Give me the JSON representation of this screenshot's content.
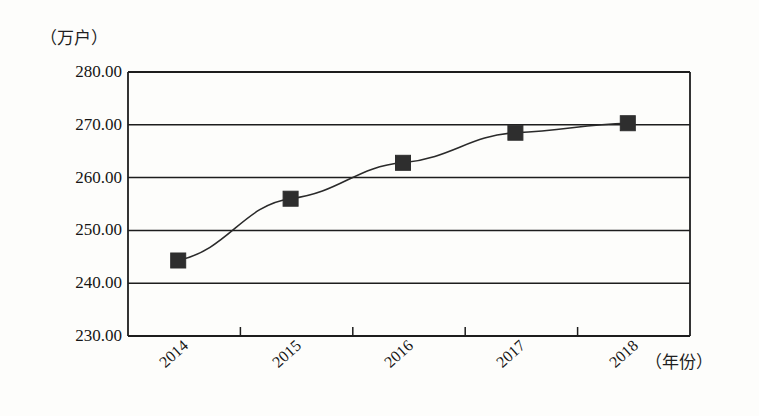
{
  "chart_data": {
    "type": "line",
    "title": "",
    "subtitle": "",
    "xlabel": "（年份）",
    "ylabel": "（万户）",
    "categories": [
      "2014",
      "2015",
      "2016",
      "2017",
      "2018"
    ],
    "series": [
      {
        "name": "",
        "values": [
          244.3,
          256.0,
          262.8,
          268.5,
          270.3
        ]
      }
    ],
    "ylim": [
      230.0,
      280.0
    ],
    "ytick_labels": [
      "280.00",
      "270.00",
      "260.00",
      "250.00",
      "240.00",
      "230.00"
    ],
    "ytick_values": [
      280.0,
      270.0,
      260.0,
      250.0,
      240.0,
      230.0
    ],
    "xtick_labels": [
      "2014",
      "2015",
      "2016",
      "2017",
      "2018"
    ],
    "grid": "horizontal",
    "legend": "none",
    "marker": "filled-square",
    "line_color": "#2a2a2a",
    "marker_color": "#2e2e2e",
    "axis_color": "#1d1d1d",
    "background_color": "#fdfdfb",
    "xlabel_rotation": -42
  },
  "axes": {
    "y_unit_label": "（万户）",
    "x_unit_label": "（年份）"
  }
}
